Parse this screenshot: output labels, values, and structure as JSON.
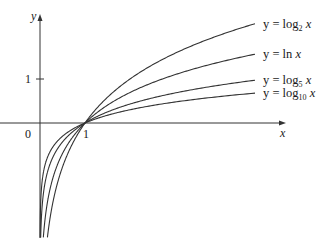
{
  "chart_data": {
    "type": "line",
    "title": "",
    "xlabel": "x",
    "ylabel": "y",
    "xlim": [
      -0.9,
      5.4
    ],
    "ylim": [
      -2.6,
      2.8
    ],
    "grid": false,
    "origin_label": "0",
    "x_ticks": [
      {
        "value": 1,
        "label": "1"
      }
    ],
    "y_ticks": [
      {
        "value": 1,
        "label": "1"
      }
    ],
    "series": [
      {
        "name": "y = log2 x",
        "base": 2,
        "label_y": "y = log",
        "label_sub": "2",
        "label_tail": " x"
      },
      {
        "name": "y = ln x",
        "base": 2.718281828,
        "label_y": "y = ln",
        "label_sub": "",
        "label_tail": " x"
      },
      {
        "name": "y = log5 x",
        "base": 5,
        "label_y": "y = log",
        "label_sub": "5",
        "label_tail": " x"
      },
      {
        "name": "y = log10 x",
        "base": 10,
        "label_y": "y = log",
        "label_sub": "10",
        "label_tail": " x"
      }
    ],
    "legend_position": "right, at curve ends"
  },
  "colors": {
    "curve": "#333333",
    "axis": "#333333",
    "text": "#1a1a1a"
  },
  "layout": {
    "origin_px": [
      40,
      123
    ],
    "unit_x_px": 45,
    "unit_y_px": 44,
    "x_end_px": 255
  }
}
